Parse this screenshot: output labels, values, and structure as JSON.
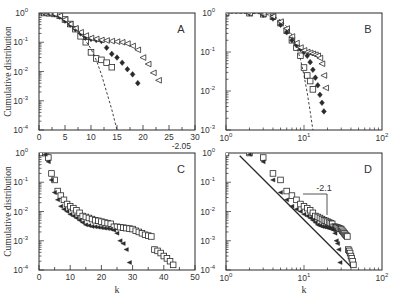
{
  "figure": {
    "ylabel": "Cumulative distribution",
    "xlabel": "k"
  },
  "chart_data": [
    {
      "panel": "A",
      "type": "scatter",
      "xscale": "linear",
      "yscale": "log",
      "xlim": [
        0,
        30
      ],
      "ylim": [
        0.0001,
        1
      ],
      "xticks": [
        0,
        5,
        10,
        15,
        20,
        25,
        30
      ],
      "yticks": [
        1,
        0.1,
        0.01,
        0.001,
        0.0001
      ],
      "ytick_labels": [
        "10^0",
        "10^-1",
        "10^-2",
        "10^-3",
        "10^-4"
      ],
      "ylabel": "Cumulative distribution",
      "xlabel": "",
      "box": [
        39,
        13,
        195,
        130
      ],
      "annotation": "",
      "series": [
        {
          "name": "squares",
          "marker": "square-open",
          "x": [
            1,
            2,
            3,
            4,
            5,
            6,
            7,
            8,
            9,
            10,
            11,
            12,
            13,
            14
          ],
          "y": [
            1,
            0.98,
            0.93,
            0.8,
            0.6,
            0.42,
            0.28,
            0.16,
            0.1,
            0.045,
            0.028,
            0.025,
            0.02,
            0.014
          ]
        },
        {
          "name": "diamonds",
          "marker": "diamond-filled",
          "x": [
            1,
            2,
            3,
            4,
            5,
            6,
            7,
            8,
            9,
            10,
            11,
            12,
            13,
            14,
            15,
            16,
            17,
            18,
            19
          ],
          "y": [
            1,
            0.97,
            0.9,
            0.75,
            0.55,
            0.4,
            0.28,
            0.2,
            0.15,
            0.13,
            0.12,
            0.11,
            0.065,
            0.04,
            0.03,
            0.02,
            0.012,
            0.008,
            0.004
          ]
        },
        {
          "name": "triangles",
          "marker": "triangle-left-open",
          "x": [
            1,
            2,
            3,
            4,
            5,
            6,
            7,
            8,
            9,
            10,
            11,
            12,
            13,
            14,
            15,
            16,
            17,
            18,
            19,
            20,
            21,
            22,
            23
          ],
          "y": [
            1,
            0.98,
            0.92,
            0.8,
            0.6,
            0.42,
            0.3,
            0.22,
            0.17,
            0.14,
            0.13,
            0.12,
            0.115,
            0.11,
            0.105,
            0.1,
            0.09,
            0.075,
            0.055,
            0.03,
            0.018,
            0.009,
            0.005
          ]
        },
        {
          "name": "fit",
          "marker": "dashed-line",
          "x": [
            0,
            2,
            4,
            6,
            8,
            10,
            11,
            12,
            13,
            14,
            15
          ],
          "y": [
            1,
            0.95,
            0.7,
            0.4,
            0.2,
            0.06,
            0.025,
            0.008,
            0.002,
            0.0005,
            0.0001
          ]
        }
      ]
    },
    {
      "panel": "B",
      "type": "scatter",
      "xscale": "log",
      "yscale": "log",
      "xlim": [
        1,
        100
      ],
      "ylim": [
        0.001,
        1
      ],
      "xticks": [
        1,
        10,
        100
      ],
      "xtick_labels": [
        "10^0",
        "10^1",
        "10^2"
      ],
      "yticks": [
        1,
        0.1,
        0.01,
        0.001
      ],
      "ytick_labels": [
        "10^0",
        "10^-1",
        "10^-2",
        "10^-3"
      ],
      "ylabel": "",
      "xlabel": "",
      "box": [
        226,
        13,
        382,
        130
      ],
      "annotation": "",
      "series": [
        {
          "name": "squares",
          "marker": "square-open",
          "x": [
            1,
            2,
            3,
            4,
            5,
            6,
            7,
            8,
            9,
            10,
            11,
            12,
            13
          ],
          "y": [
            1,
            0.99,
            0.93,
            0.8,
            0.55,
            0.35,
            0.2,
            0.13,
            0.08,
            0.04,
            0.025,
            0.018,
            0.011
          ]
        },
        {
          "name": "diamonds",
          "marker": "diamond-filled",
          "x": [
            1,
            2,
            3,
            4,
            5,
            6,
            7,
            8,
            9,
            10,
            11,
            12,
            13,
            14,
            15,
            16,
            17,
            18
          ],
          "y": [
            1,
            0.98,
            0.9,
            0.72,
            0.5,
            0.32,
            0.2,
            0.15,
            0.12,
            0.1,
            0.08,
            0.055,
            0.035,
            0.022,
            0.014,
            0.008,
            0.005,
            0.003
          ]
        },
        {
          "name": "triangles",
          "marker": "triangle-left-open",
          "x": [
            1,
            2,
            3,
            4,
            5,
            6,
            7,
            8,
            9,
            10,
            11,
            12,
            13,
            14,
            15,
            16,
            17,
            18,
            19
          ],
          "y": [
            1,
            0.99,
            0.94,
            0.82,
            0.6,
            0.4,
            0.25,
            0.17,
            0.13,
            0.11,
            0.1,
            0.095,
            0.09,
            0.085,
            0.08,
            0.07,
            0.05,
            0.025,
            0.012
          ]
        },
        {
          "name": "fit",
          "marker": "dashed-line",
          "x": [
            1,
            2,
            3,
            4,
            5,
            6,
            7,
            8,
            9,
            10,
            11,
            12,
            13
          ],
          "y": [
            1,
            0.99,
            0.95,
            0.85,
            0.65,
            0.45,
            0.27,
            0.14,
            0.065,
            0.025,
            0.009,
            0.003,
            0.001
          ]
        }
      ]
    },
    {
      "panel": "C",
      "type": "scatter",
      "xscale": "linear",
      "yscale": "log",
      "xlim": [
        0,
        50
      ],
      "ylim": [
        0.0001,
        1
      ],
      "xticks": [
        0,
        10,
        20,
        30,
        40,
        50
      ],
      "yticks": [
        1,
        0.1,
        0.01,
        0.001,
        0.0001
      ],
      "ytick_labels": [
        "10^0",
        "10^-1",
        "10^-2",
        "10^-3",
        "10^-4"
      ],
      "ylabel": "Cumulative distribution",
      "xlabel": "k",
      "box": [
        39,
        153,
        195,
        270
      ],
      "annotation": "-2.05",
      "series": [
        {
          "name": "squares",
          "marker": "square-open",
          "x": [
            1,
            2,
            3,
            4,
            5,
            6,
            7,
            8,
            9,
            10,
            11,
            12,
            13,
            14,
            15,
            16,
            17,
            18,
            19,
            20,
            21,
            22,
            23,
            24,
            25,
            26,
            27,
            28,
            29,
            30,
            31,
            32,
            33,
            34,
            35,
            36,
            37,
            38,
            39,
            40,
            41,
            42,
            43
          ],
          "y": [
            1,
            1,
            0.7,
            0.2,
            0.12,
            0.05,
            0.035,
            0.025,
            0.018,
            0.015,
            0.013,
            0.011,
            0.009,
            0.007,
            0.0065,
            0.006,
            0.0055,
            0.005,
            0.0048,
            0.0045,
            0.0042,
            0.004,
            0.0038,
            0.003,
            0.003,
            0.0029,
            0.0028,
            0.0027,
            0.0026,
            0.0025,
            0.0022,
            0.002,
            0.0018,
            0.0016,
            0.0015,
            0.0014,
            0.0005,
            0.00045,
            0.00038,
            0.0003,
            0.00025,
            0.0002,
            0.00015
          ]
        },
        {
          "name": "triangles",
          "marker": "triangle-left-filled",
          "x": [
            2,
            3,
            4,
            5,
            6,
            7,
            8,
            9,
            10,
            11,
            12,
            13,
            14,
            15,
            16,
            17,
            18,
            19,
            20,
            21,
            22,
            23,
            24,
            25,
            26,
            27,
            28,
            29
          ],
          "y": [
            0.9,
            0.5,
            0.12,
            0.045,
            0.025,
            0.015,
            0.012,
            0.01,
            0.008,
            0.007,
            0.006,
            0.005,
            0.0042,
            0.0035,
            0.0033,
            0.0031,
            0.003,
            0.0029,
            0.0028,
            0.0027,
            0.0026,
            0.0025,
            0.0023,
            0.0018,
            0.001,
            0.0008,
            0.0005,
            0.00018
          ]
        }
      ]
    },
    {
      "panel": "D",
      "type": "scatter",
      "xscale": "log",
      "yscale": "log",
      "xlim": [
        1,
        100
      ],
      "ylim": [
        0.0001,
        1
      ],
      "xticks": [
        1,
        10,
        100
      ],
      "xtick_labels": [
        "10^0",
        "10^1",
        "10^2"
      ],
      "yticks": [
        1,
        0.1,
        0.01,
        0.001,
        0.0001
      ],
      "ytick_labels": [
        "10^0",
        "10^-1",
        "10^-2",
        "10^-3",
        "10^-4"
      ],
      "ylabel": "",
      "xlabel": "k",
      "box": [
        226,
        153,
        382,
        270
      ],
      "annotation": "-2.1",
      "series": [
        {
          "name": "squares",
          "marker": "square-open",
          "x": [
            1,
            2,
            3,
            4,
            5,
            6,
            7,
            8,
            9,
            10,
            11,
            12,
            13,
            14,
            15,
            16,
            17,
            18,
            19,
            20,
            21,
            22,
            23,
            24,
            25,
            26,
            27,
            28,
            29,
            30,
            31,
            32,
            33,
            34,
            35,
            36,
            37,
            38,
            39,
            40,
            41,
            42,
            43
          ],
          "y": [
            1,
            1,
            0.7,
            0.2,
            0.12,
            0.05,
            0.035,
            0.025,
            0.018,
            0.015,
            0.013,
            0.011,
            0.009,
            0.007,
            0.0065,
            0.006,
            0.0055,
            0.005,
            0.0048,
            0.0045,
            0.0042,
            0.004,
            0.0038,
            0.003,
            0.003,
            0.0029,
            0.0028,
            0.0027,
            0.0026,
            0.0025,
            0.0022,
            0.002,
            0.0018,
            0.0016,
            0.0015,
            0.0014,
            0.0005,
            0.00045,
            0.00038,
            0.0003,
            0.00025,
            0.0002,
            0.00015
          ]
        },
        {
          "name": "triangles",
          "marker": "triangle-left-filled",
          "x": [
            2,
            3,
            4,
            5,
            6,
            7,
            8,
            9,
            10,
            11,
            12,
            13,
            14,
            15,
            16,
            17,
            18,
            19,
            20,
            21,
            22,
            23,
            24,
            25,
            26,
            27,
            28,
            29
          ],
          "y": [
            0.9,
            0.5,
            0.12,
            0.045,
            0.025,
            0.015,
            0.012,
            0.01,
            0.008,
            0.007,
            0.006,
            0.005,
            0.0042,
            0.0035,
            0.0033,
            0.0031,
            0.003,
            0.0029,
            0.0028,
            0.0027,
            0.0026,
            0.0025,
            0.0023,
            0.0018,
            0.001,
            0.0008,
            0.0005,
            0.00018
          ]
        },
        {
          "name": "power-law-fit",
          "marker": "solid-line",
          "x": [
            1.5,
            40
          ],
          "y": [
            0.8,
            0.00013
          ]
        }
      ]
    }
  ]
}
